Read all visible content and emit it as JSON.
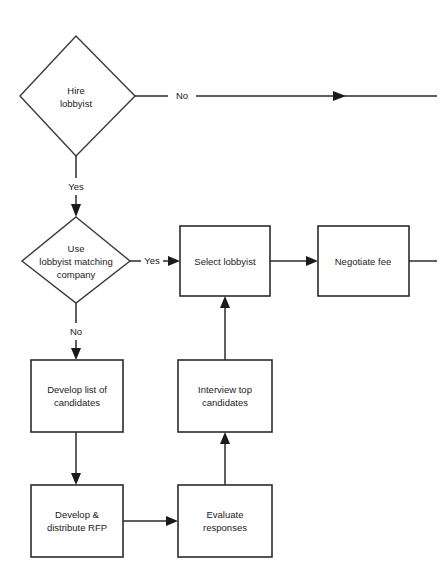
{
  "diagram": {
    "type": "flowchart",
    "background_color": "#ffffff",
    "line_color": "#2b2b2b",
    "text_color": "#1b1b1b",
    "nodes": [
      {
        "id": "hire-lobbyist",
        "shape": "decision",
        "lines": [
          "Hire",
          "lobbyist"
        ]
      },
      {
        "id": "use-matching-company",
        "shape": "decision",
        "lines": [
          "Use",
          "lobbyist matching",
          "company"
        ]
      },
      {
        "id": "select-lobbyist",
        "shape": "process",
        "lines": [
          "Select lobbyist"
        ]
      },
      {
        "id": "negotiate-fee",
        "shape": "process",
        "lines": [
          "Negotiate fee"
        ]
      },
      {
        "id": "develop-list",
        "shape": "process",
        "lines": [
          "Develop list of",
          "candidates"
        ]
      },
      {
        "id": "interview-top",
        "shape": "process",
        "lines": [
          "Interview top",
          "candidates"
        ]
      },
      {
        "id": "develop-rfp",
        "shape": "process",
        "lines": [
          "Develop &",
          "distribute RFP"
        ]
      },
      {
        "id": "evaluate-responses",
        "shape": "process",
        "lines": [
          "Evaluate",
          "responses"
        ]
      }
    ],
    "edge_labels": {
      "hire_no": "No",
      "hire_yes": "Yes",
      "matching_yes": "Yes",
      "matching_no": "No"
    }
  }
}
